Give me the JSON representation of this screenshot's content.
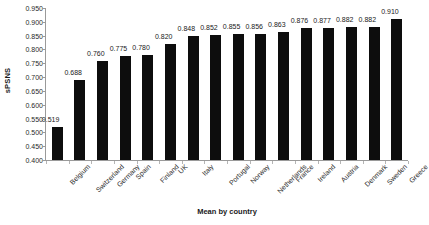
{
  "chart_data": {
    "type": "bar",
    "title": "",
    "xlabel": "Mean by country",
    "ylabel": "sPSNS",
    "ylim": [
      0.4,
      0.95
    ],
    "ytick_step": 0.05,
    "grid": false,
    "legend": null,
    "bar_color": "#0d0d0d",
    "background_color": "#ffffff",
    "axis_color": "#9a9a9a",
    "ytick_labels": [
      "0.950",
      "0.900",
      "0.850",
      "0.800",
      "0.750",
      "0.700",
      "0.650",
      "0.600",
      "0.550",
      "0.500",
      "0.450",
      "0.400"
    ],
    "ytick_values": [
      0.95,
      0.9,
      0.85,
      0.8,
      0.75,
      0.7,
      0.65,
      0.6,
      0.55,
      0.5,
      0.45,
      0.4
    ],
    "categories": [
      "Belgium",
      "Switzerland",
      "Germany",
      "Spain",
      "Finland",
      "UK",
      "Italy",
      "Portugal",
      "Norway",
      "Netherlands",
      "France",
      "Ireland",
      "Austria",
      "Denmark",
      "Sweden",
      "Greece"
    ],
    "values": [
      0.519,
      0.688,
      0.76,
      0.775,
      0.78,
      0.82,
      0.848,
      0.852,
      0.855,
      0.856,
      0.863,
      0.876,
      0.877,
      0.882,
      0.882,
      0.91
    ],
    "value_labels": [
      "0.519",
      "0.688",
      "0.760",
      "0.775",
      "0.780",
      "0.820",
      "0.848",
      "0.852",
      "0.855",
      "0.856",
      "0.863",
      "0.876",
      "0.877",
      "0.882",
      "0.882",
      "0.910"
    ]
  }
}
